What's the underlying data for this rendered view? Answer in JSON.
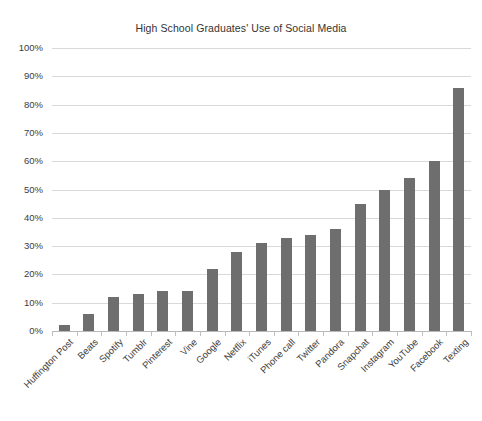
{
  "chart_data": {
    "type": "bar",
    "title": "High School Graduates' Use of Social Media",
    "xlabel": "",
    "ylabel": "",
    "ylim": [
      0,
      100
    ],
    "ytick_labels": [
      "100%",
      "90%",
      "80%",
      "70%",
      "60%",
      "50%",
      "40%",
      "30%",
      "20%",
      "10%",
      "0%"
    ],
    "ytick_values": [
      100,
      90,
      80,
      70,
      60,
      50,
      40,
      30,
      20,
      10,
      0
    ],
    "grid": "horizontal",
    "legend": "none",
    "value_suffix": "%",
    "bar_color": "#6e6e6e",
    "categories": [
      "Huffington Post",
      "Beats",
      "Spotify",
      "Tumblr",
      "Pinterest",
      "Vine",
      "Google",
      "Netflix",
      "iTunes",
      "Phone call",
      "Twitter",
      "Pandora",
      "Snapchat",
      "Instagram",
      "YouTube",
      "Facebook",
      "Texting"
    ],
    "values": [
      2,
      6,
      12,
      13,
      14,
      14,
      22,
      28,
      31,
      33,
      34,
      36,
      45,
      50,
      54,
      60,
      86
    ]
  }
}
